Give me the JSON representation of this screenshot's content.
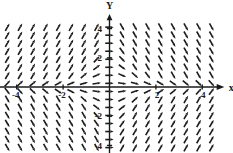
{
  "figure": {
    "kind": "vector-field",
    "background": "#ffffff",
    "ink": "#1a1a1a"
  },
  "axes": {
    "x_axis_label": "x",
    "y_axis_label": "Y",
    "x_ticks": [
      {
        "value": -4,
        "label": "-4"
      },
      {
        "value": -2,
        "label": "-2"
      },
      {
        "value": 2,
        "label": "2"
      },
      {
        "value": 4,
        "label": "4"
      }
    ],
    "y_ticks": [
      {
        "value": -4,
        "label": "-4"
      },
      {
        "value": -2,
        "label": "-2"
      },
      {
        "value": 2,
        "label": "2"
      },
      {
        "value": 4,
        "label": "4"
      }
    ],
    "xlim": [
      -5.0,
      5.0
    ],
    "ylim": [
      -5.0,
      5.0
    ],
    "grid": false,
    "axis_arrowheads": [
      "x-positive",
      "y-positive"
    ]
  },
  "chart_data": {
    "type": "scatter",
    "title": "",
    "xlabel": "x",
    "ylabel": "Y",
    "xlim": [
      -5.0,
      5.0
    ],
    "ylim": [
      -5.0,
      5.0
    ],
    "grid": false,
    "field": {
      "description": "direction field of unit arrows on a rectangular lattice",
      "x_start": -4.4,
      "x_end": 4.4,
      "x_step": 0.55,
      "y_start": -4.15,
      "y_end": 4.15,
      "y_step": 0.55,
      "arrow_length_px": 8.5,
      "arrow_head_px": 3.4,
      "arrow_width_px": 1.6,
      "formula_u": "1",
      "formula_v": "-x*y",
      "normalized": true,
      "notes": "arrows tilt up-right left of the y-axis above the x-axis, down-right right of the y-axis above the x-axis, and mirror below; arrows are horizontal along both axes"
    }
  }
}
